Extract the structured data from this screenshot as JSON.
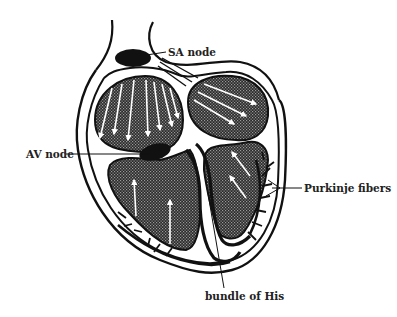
{
  "diagram": {
    "labels": {
      "sa_node": "SA node",
      "av_node": "AV node",
      "purkinje": "Purkinje fibers",
      "bundle_of_his": "bundle of His"
    }
  },
  "colors": {
    "ink": "#111111",
    "chamber_fill": "#3a3a3a",
    "background": "#ffffff",
    "arrow": "#ffffff"
  }
}
